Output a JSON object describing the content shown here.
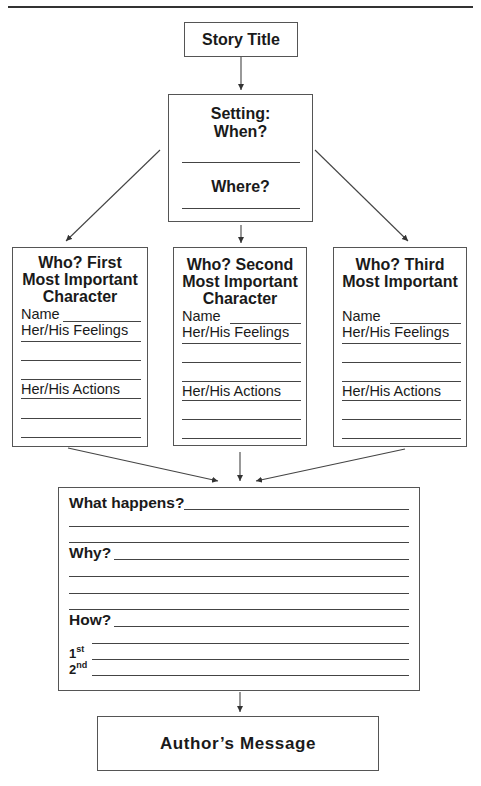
{
  "diagram": {
    "title_box": {
      "label": "Story Title"
    },
    "setting_box": {
      "heading_line1": "Setting:",
      "heading_line2": "When?",
      "where_label": "Where?"
    },
    "characters": [
      {
        "heading_line1": "Who?  First",
        "heading_line2": "Most Important",
        "heading_line3": "Character",
        "name_label": "Name",
        "feelings_label": "Her/His Feelings",
        "actions_label": "Her/His Actions"
      },
      {
        "heading_line1": "Who?  Second",
        "heading_line2": "Most Important",
        "heading_line3": "Character",
        "name_label": "Name",
        "feelings_label": "Her/His Feelings",
        "actions_label": "Her/His Actions"
      },
      {
        "heading_line1": "Who?  Third",
        "heading_line2": "Most Important",
        "heading_line3": "",
        "name_label": "Name",
        "feelings_label": "Her/His Feelings",
        "actions_label": "Her/His Actions"
      }
    ],
    "plot_box": {
      "what_label": "What happens?",
      "why_label": "Why?",
      "how_label": "How?",
      "first_num": "1",
      "first_sup": "st",
      "second_num": "2",
      "second_sup": "nd"
    },
    "message_box": {
      "label": "Author’s Message"
    }
  }
}
